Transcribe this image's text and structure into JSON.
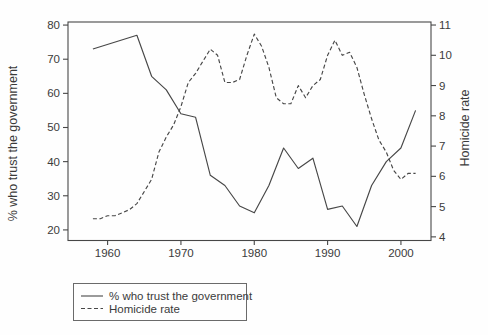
{
  "chart_data": {
    "type": "line",
    "title": "",
    "x_axis": {
      "ticks": [
        1960,
        1970,
        1980,
        1990,
        2000
      ],
      "range": [
        1954.6,
        2004.1
      ],
      "grid": false
    },
    "left_axis": {
      "label": "% who trust the government",
      "ticks": [
        20,
        30,
        40,
        50,
        60,
        70,
        80
      ],
      "range": [
        16.9,
        80.9
      ]
    },
    "right_axis": {
      "label": "Homicide rate",
      "ticks": [
        4,
        5,
        6,
        7,
        8,
        9,
        10,
        11
      ],
      "range": [
        3.88,
        11.1
      ]
    },
    "legend": {
      "position": "bottom-left",
      "border": true
    },
    "series": [
      {
        "name": "% who trust the government",
        "axis": "left",
        "line_style": "solid",
        "color": "#474747",
        "x": [
          1958,
          1964,
          1966,
          1968,
          1970,
          1972,
          1974,
          1976,
          1978,
          1980,
          1982,
          1984,
          1986,
          1988,
          1990,
          1992,
          1994,
          1996,
          1998,
          2000,
          2002
        ],
        "y": [
          73,
          77,
          65,
          61,
          54,
          53,
          36,
          33,
          27,
          25,
          33,
          44,
          38,
          41,
          26,
          27,
          21,
          33,
          40,
          44,
          55
        ]
      },
      {
        "name": "Homicide rate",
        "axis": "right",
        "line_style": "dashed",
        "color": "#474747",
        "x": [
          1958,
          1959,
          1960,
          1961,
          1962,
          1963,
          1964,
          1965,
          1966,
          1967,
          1968,
          1969,
          1970,
          1971,
          1972,
          1973,
          1974,
          1975,
          1976,
          1977,
          1978,
          1979,
          1980,
          1981,
          1982,
          1983,
          1984,
          1985,
          1986,
          1987,
          1988,
          1989,
          1990,
          1991,
          1992,
          1993,
          1994,
          1995,
          1996,
          1997,
          1998,
          1999,
          2000,
          2001,
          2002
        ],
        "y": [
          4.6,
          4.6,
          4.7,
          4.7,
          4.8,
          4.9,
          5.1,
          5.5,
          5.9,
          6.8,
          7.3,
          7.7,
          8.3,
          9.1,
          9.4,
          9.8,
          10.2,
          10.0,
          9.1,
          9.1,
          9.2,
          10.0,
          10.7,
          10.3,
          9.6,
          8.6,
          8.4,
          8.4,
          9.0,
          8.6,
          9.0,
          9.2,
          10.0,
          10.5,
          10.0,
          10.1,
          9.6,
          8.7,
          7.9,
          7.2,
          6.8,
          6.2,
          5.9,
          6.1,
          6.1
        ]
      }
    ],
    "colors": {
      "line": "#474747",
      "text": "#3b3b3b",
      "background": "#fefefe"
    }
  }
}
